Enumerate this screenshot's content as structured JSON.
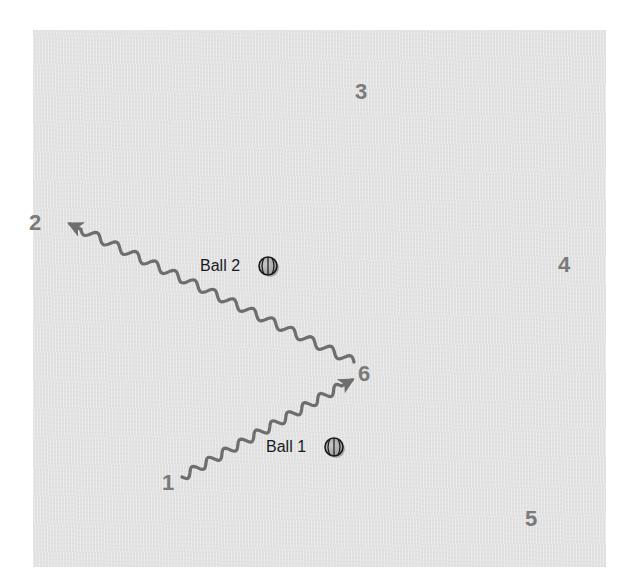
{
  "diagram": {
    "background_color": "#e6e6e6",
    "path_color": "#6e6e6e",
    "label_color": "#7a7a7a",
    "positions": [
      {
        "id": "1",
        "label": "1",
        "x": 168,
        "y": 483
      },
      {
        "id": "2",
        "label": "2",
        "x": 35,
        "y": 223
      },
      {
        "id": "3",
        "label": "3",
        "x": 361,
        "y": 92
      },
      {
        "id": "4",
        "label": "4",
        "x": 564,
        "y": 265
      },
      {
        "id": "5",
        "label": "5",
        "x": 531,
        "y": 519
      },
      {
        "id": "6",
        "label": "6",
        "x": 364,
        "y": 374
      }
    ],
    "balls": [
      {
        "id": "ball-1",
        "label": "Ball 1",
        "text_x": 266,
        "y": 447,
        "icon_x": 334
      },
      {
        "id": "ball-2",
        "label": "Ball 2",
        "text_x": 200,
        "y": 266,
        "icon_x": 268
      }
    ],
    "paths": [
      {
        "id": "path-1-to-6",
        "from": "1",
        "to": "6",
        "type": "wavy-arrow",
        "start": [
          182,
          477
        ],
        "end": [
          352,
          380
        ],
        "cycles": 10
      },
      {
        "id": "path-6-to-2",
        "from": "6",
        "to": "2",
        "type": "wavy-arrow",
        "start": [
          354,
          362
        ],
        "end": [
          70,
          224
        ],
        "cycles": 14
      }
    ]
  }
}
